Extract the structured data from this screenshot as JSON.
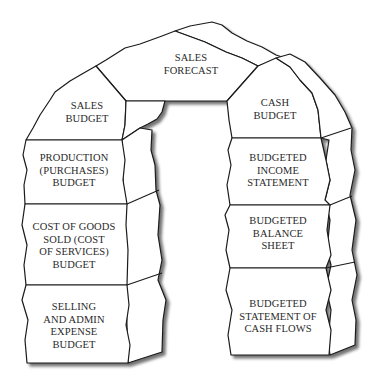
{
  "diagram": {
    "type": "arch",
    "keystone": {
      "label": "SALES\nFORECAST"
    },
    "left_pillar": [
      {
        "label": "SALES\nBUDGET"
      },
      {
        "label": "PRODUCTION\n(PURCHASES)\nBUDGET"
      },
      {
        "label": "COST OF GOODS\nSOLD (COST\nOF SERVICES)\nBUDGET"
      },
      {
        "label": "SELLING\nAND ADMIN\nEXPENSE\nBUDGET"
      }
    ],
    "right_pillar": [
      {
        "label": "CASH\nBUDGET"
      },
      {
        "label": "BUDGETED\nINCOME\nSTATEMENT"
      },
      {
        "label": "BUDGETED\nBALANCE\nSHEET"
      },
      {
        "label": "BUDGETED\nSTATEMENT OF\nCASH FLOWS"
      }
    ],
    "colors": {
      "stroke": "#1a1a1a",
      "fill": "#ffffff",
      "shadow": "#9a9a9a",
      "text": "#2a2a2a"
    }
  }
}
